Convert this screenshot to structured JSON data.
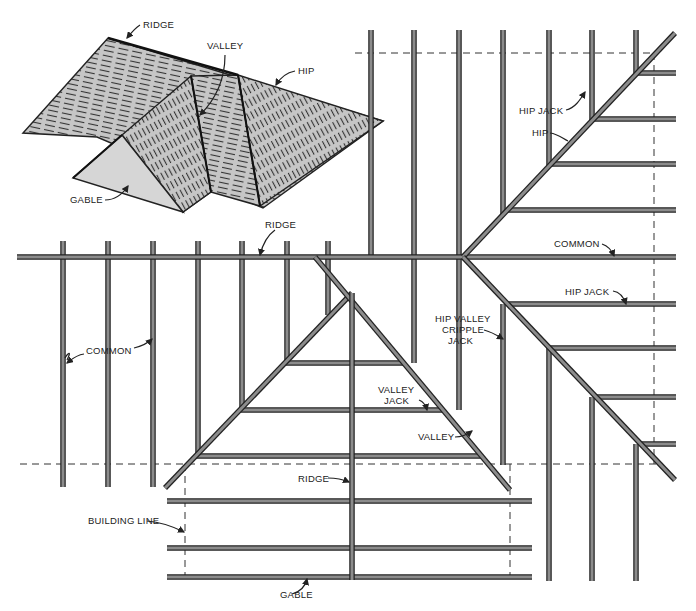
{
  "colors": {
    "member_fill": "#8c8c8c",
    "member_stroke": "#222222",
    "roof_fill": "#b9b9b9",
    "gable_fill": "#d4d4d4",
    "dash": "#333333"
  },
  "inset_labels": [
    {
      "text": "RIDGE",
      "x": 143,
      "y": 28
    },
    {
      "text": "VALLEY",
      "x": 207,
      "y": 49
    },
    {
      "text": "HIP",
      "x": 298,
      "y": 74
    },
    {
      "text": "GABLE",
      "x": 70,
      "y": 203
    }
  ],
  "plan_labels": [
    {
      "text": "HIP JACK",
      "x": 519,
      "y": 114
    },
    {
      "text": "HIP",
      "x": 532,
      "y": 136
    },
    {
      "text": "RIDGE",
      "x": 265,
      "y": 228
    },
    {
      "text": "COMMON",
      "x": 554,
      "y": 247
    },
    {
      "text": "HIP JACK",
      "x": 565,
      "y": 295
    },
    {
      "text": "HIP VALLEY",
      "x": 435,
      "y": 322
    },
    {
      "text": "CRIPPLE",
      "x": 442,
      "y": 333
    },
    {
      "text": "JACK",
      "x": 448,
      "y": 344
    },
    {
      "text": "COMMON",
      "x": 86,
      "y": 354
    },
    {
      "text": "VALLEY",
      "x": 378,
      "y": 393
    },
    {
      "text": "JACK",
      "x": 384,
      "y": 404
    },
    {
      "text": "VALLEY",
      "x": 418,
      "y": 440
    },
    {
      "text": "RIDGE",
      "x": 298,
      "y": 482
    },
    {
      "text": "BUILDING LINE",
      "x": 88,
      "y": 524
    },
    {
      "text": "GABLE",
      "x": 280,
      "y": 598
    }
  ],
  "plan_members": {
    "main_ridge": [
      17,
      257,
      676,
      257
    ],
    "left_commons_x": [
      63,
      108,
      153,
      198,
      242,
      287,
      328
    ],
    "left_commons_y": [
      241,
      487
    ],
    "top_commons_x": [
      371,
      414,
      459,
      503,
      549,
      592,
      636
    ],
    "top_commons_y1": 30,
    "hips": [
      [
        463,
        257,
        675,
        33
      ],
      [
        463,
        257,
        675,
        480
      ]
    ],
    "right_jacks_upper_y": [
      73,
      119,
      164,
      210
    ],
    "right_jacks_lower_y": [
      304,
      348,
      397,
      444
    ],
    "gable_ridge": [
      352,
      293,
      352,
      580
    ],
    "valleys": [
      [
        165,
        488,
        352,
        293
      ],
      [
        315,
        257,
        510,
        490
      ]
    ],
    "valley_jacks_y": [
      363,
      410,
      456
    ],
    "gable_rafters_y": [
      501,
      548,
      577
    ],
    "gable_rafters_x": [
      167,
      532
    ],
    "dash_top": [
      355,
      53,
      655,
      53
    ],
    "dash_left": [
      20,
      464,
      505,
      464
    ],
    "building_lines_x": [
      185,
      510
    ],
    "dash_right_x": 654
  }
}
